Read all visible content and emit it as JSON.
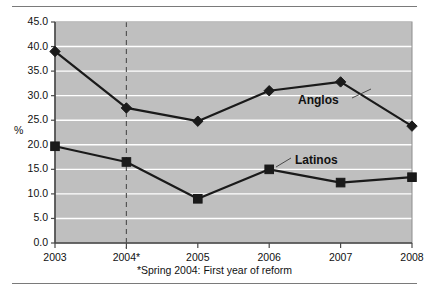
{
  "chart_data": {
    "type": "line",
    "title": "",
    "subtitle": "",
    "xlabel": "",
    "ylabel": "%",
    "categories": [
      "2003",
      "2004*",
      "2005",
      "2006",
      "2007",
      "2008"
    ],
    "ylim": [
      0.0,
      45.0
    ],
    "ytick_labels": [
      "0.0",
      "5.0",
      "10.0",
      "15.0",
      "20.0",
      "25.0",
      "30.0",
      "35.0",
      "40.0",
      "45.0"
    ],
    "ytick_values": [
      0.0,
      5.0,
      10.0,
      15.0,
      20.0,
      25.0,
      30.0,
      35.0,
      40.0,
      45.0
    ],
    "grid": true,
    "grid_color": "#ffffff",
    "plot_background": "#bfbfbf",
    "legend_position": "inline-labels",
    "series": [
      {
        "name": "Anglos",
        "marker": "diamond",
        "color": "#1a1a1a",
        "values": [
          39.0,
          27.5,
          24.8,
          31.0,
          32.8,
          23.8
        ]
      },
      {
        "name": "Latinos",
        "marker": "square",
        "color": "#1a1a1a",
        "values": [
          19.7,
          16.5,
          9.0,
          15.0,
          12.3,
          13.4
        ]
      }
    ],
    "annotations": [
      {
        "text": "*Spring 2004: First year of reform",
        "position": "below-axis"
      },
      {
        "text": "2004* reference line",
        "type": "vertical-dashed",
        "at_category": "2004*"
      }
    ]
  },
  "footnote": "*Spring 2004: First year of reform",
  "axis_unit": "%",
  "labels": {
    "anglos": "Anglos",
    "latinos": "Latinos"
  }
}
